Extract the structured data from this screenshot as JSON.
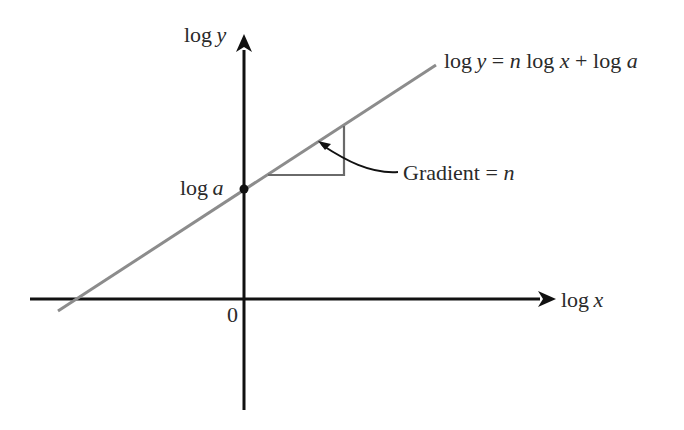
{
  "diagram": {
    "y_axis_label": {
      "prefix": "log",
      "var": "y"
    },
    "x_axis_label": {
      "prefix": "log",
      "var": "x"
    },
    "origin_label": "0",
    "intercept_label": {
      "prefix": "log",
      "var": "a"
    },
    "line_equation": {
      "p1": "log",
      "v1": "y",
      "p2": " = ",
      "v2": "n",
      "p3": " log ",
      "v3": "x",
      "p4": " + log ",
      "v4": "a"
    },
    "gradient_label": {
      "text": "Gradient = ",
      "var": "n"
    },
    "colors": {
      "axes": "#111111",
      "line": "#8c8c8c",
      "triangle": "#6a6a6a"
    }
  }
}
